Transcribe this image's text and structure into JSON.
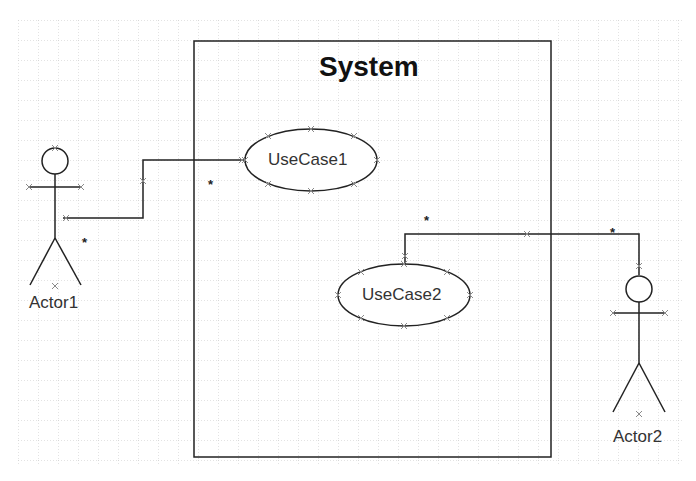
{
  "diagram": {
    "type": "uml-use-case",
    "grid": {
      "origin_x": 18,
      "origin_y": 20,
      "spacing": 20,
      "color": "#c8c8c8"
    },
    "colors": {
      "line": "#222222",
      "handle": "#888888",
      "background": "#ffffff"
    },
    "system": {
      "title": "System",
      "x": 194,
      "y": 41,
      "width": 357,
      "height": 416
    },
    "use_cases": [
      {
        "id": "uc1",
        "label": "UseCase1",
        "cx": 311,
        "cy": 160,
        "rx": 66,
        "ry": 31
      },
      {
        "id": "uc2",
        "label": "UseCase2",
        "cx": 404,
        "cy": 295,
        "rx": 66,
        "ry": 31
      }
    ],
    "actors": [
      {
        "id": "a1",
        "label": "Actor1",
        "cx": 55,
        "head_cy": 160
      },
      {
        "id": "a2",
        "label": "Actor2",
        "cx": 639,
        "head_cy": 288
      }
    ],
    "associations": [
      {
        "from": "Actor1",
        "to": "UseCase1",
        "multiplicity_from": "*",
        "multiplicity_to": "*"
      },
      {
        "from": "UseCase2",
        "to": "Actor2",
        "multiplicity_from": "*",
        "multiplicity_to": "*"
      }
    ]
  },
  "labels": {
    "system_title": "System",
    "usecase1": "UseCase1",
    "usecase2": "UseCase2",
    "actor1": "Actor1",
    "actor2": "Actor2",
    "mult_a1_near_actor": "*",
    "mult_a1_near_uc": "*",
    "mult_a2_near_uc": "*",
    "mult_a2_near_actor": "*"
  }
}
